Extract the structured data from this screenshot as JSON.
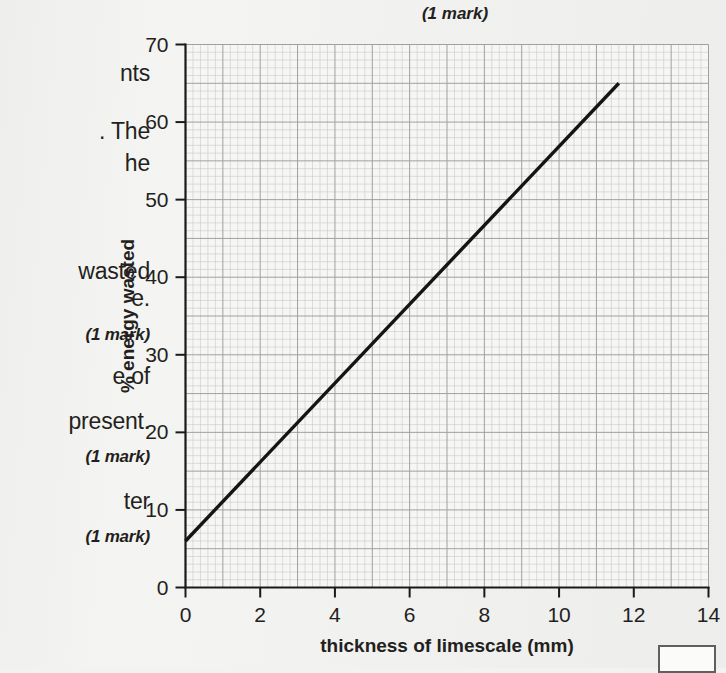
{
  "page": {
    "background": "#f2f2f0",
    "top_mark": "(1 mark)",
    "answer_box_label": ""
  },
  "question_text_fragments": [
    {
      "text": "nts",
      "top": 60,
      "style": "normal"
    },
    {
      "text": ". The",
      "top": 118,
      "style": "normal"
    },
    {
      "text": "he",
      "top": 150,
      "style": "normal"
    },
    {
      "text": "wasted",
      "top": 258,
      "style": "normal"
    },
    {
      "text": "e.",
      "top": 285,
      "style": "normal"
    },
    {
      "text": "(1 mark)",
      "top": 325,
      "style": "mark"
    },
    {
      "text": "e of",
      "top": 363,
      "style": "normal"
    },
    {
      "text": "present.",
      "top": 408,
      "style": "normal"
    },
    {
      "text": "(1 mark)",
      "top": 447,
      "style": "mark"
    },
    {
      "text": "ter",
      "top": 488,
      "style": "normal"
    },
    {
      "text": "(1 mark)",
      "top": 527,
      "style": "mark"
    }
  ],
  "chart_data": {
    "type": "line",
    "title": "",
    "xlabel": "thickness of limescale (mm)",
    "ylabel": "% energy wasted",
    "xlim": [
      0,
      14
    ],
    "ylim": [
      0,
      70
    ],
    "xticks": [
      0,
      2,
      4,
      6,
      8,
      10,
      12,
      14
    ],
    "yticks": [
      0,
      10,
      20,
      30,
      40,
      50,
      60,
      70
    ],
    "grid": true,
    "grid_minor_step_x": 0.2,
    "grid_minor_step_y": 1,
    "grid_major_step_x": 1,
    "grid_major_step_y": 5,
    "legend": "none",
    "series": [
      {
        "name": "% energy wasted vs thickness of limescale",
        "color": "#141414",
        "x": [
          0,
          11.6
        ],
        "y": [
          6,
          65
        ]
      }
    ],
    "annotations": []
  }
}
